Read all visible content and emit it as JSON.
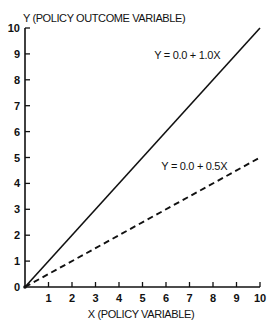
{
  "chart_data": {
    "type": "line",
    "title": "",
    "xlabel": "X (POLICY VARIABLE)",
    "ylabel": "Y (POLICY OUTCOME VARIABLE)",
    "xlim": [
      0,
      10
    ],
    "ylim": [
      0,
      10
    ],
    "xticks": [
      1,
      2,
      3,
      4,
      5,
      6,
      7,
      8,
      9,
      10
    ],
    "yticks": [
      0,
      1,
      2,
      3,
      4,
      5,
      6,
      7,
      8,
      9,
      10
    ],
    "grid": false,
    "legend": "none",
    "series": [
      {
        "name": "Y = 0.0 + 1.0X",
        "intercept": 0.0,
        "slope": 1.0,
        "style": "solid",
        "x": [
          0,
          10
        ],
        "y": [
          0,
          10
        ],
        "annotation": {
          "text": "Y = 0.0 + 1.0X",
          "x": 5.5,
          "y": 8.8
        }
      },
      {
        "name": "Y = 0.0 + 0.5X",
        "intercept": 0.0,
        "slope": 0.5,
        "style": "dashed",
        "x": [
          0,
          10
        ],
        "y": [
          0,
          5
        ],
        "annotation": {
          "text": "Y = 0.0 + 0.5X",
          "x": 5.8,
          "y": 4.5
        }
      }
    ],
    "color": "#111111"
  }
}
